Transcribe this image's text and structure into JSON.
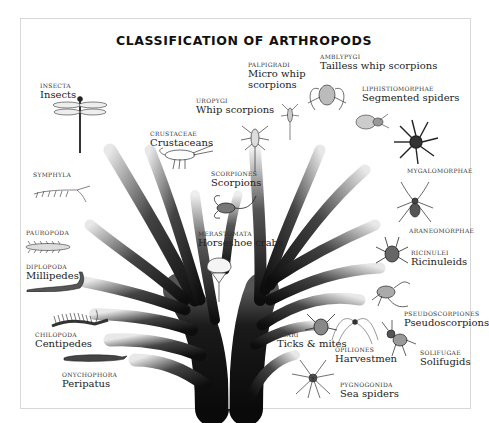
{
  "title": "CLASSIFICATION OF ARTHROPODS",
  "colors": {
    "branch": "#111111",
    "background": "#ffffff",
    "frame": "#d8d8d8",
    "text": "#1a1a1a"
  },
  "groups": [
    {
      "id": "insecta",
      "scientific": "INSECTA",
      "common": "Insects",
      "icon": "dragonfly-icon"
    },
    {
      "id": "crustaceae",
      "scientific": "CRUSTACEAE",
      "common": "Crustaceans",
      "icon": "lobster-icon"
    },
    {
      "id": "uropygi",
      "scientific": "UROPYGI",
      "common": "Whip scorpions",
      "icon": "whip-scorpion-icon"
    },
    {
      "id": "palpigradi",
      "scientific": "PALPIGRADI",
      "common": "Micro whip scorpions",
      "common_lines": [
        "Micro whip",
        "scorpions"
      ],
      "icon": "micro-whip-scorpion-icon"
    },
    {
      "id": "amblypygi",
      "scientific": "AMBLYPYGI",
      "common": "Tailless whip scorpions",
      "icon": "tailless-whip-scorpion-icon"
    },
    {
      "id": "liphistiomorphae",
      "scientific": "LIPHISTIOMORPHAE",
      "common": "Segmented spiders",
      "icon": "segmented-spider-icon"
    },
    {
      "id": "mygalomorphae",
      "scientific": "MYGALOMORPHAE",
      "common": "",
      "icon": "tarantula-icon"
    },
    {
      "id": "araneomorphae",
      "scientific": "ARANEOMORPHAE",
      "common": "",
      "icon": "spider-icon"
    },
    {
      "id": "ricinulei",
      "scientific": "RICINULEI",
      "common": "Ricinuleids",
      "icon": "ricinuleid-icon"
    },
    {
      "id": "pseudoscorpiones",
      "scientific": "PSEUDOSCORPIONES",
      "common": "Pseudoscorpions",
      "icon": "pseudoscorpion-icon"
    },
    {
      "id": "solifugae",
      "scientific": "SOLIFUGAE",
      "common": "Solifugids",
      "icon": "solifugid-icon"
    },
    {
      "id": "opiliones",
      "scientific": "OPILIONES",
      "common": "Harvestmen",
      "icon": "harvestman-icon"
    },
    {
      "id": "acari",
      "scientific": "ACARI",
      "common": "Ticks & mites",
      "icon": "mite-icon"
    },
    {
      "id": "pygnogonida",
      "scientific": "PYGNOGONIDA",
      "common": "Sea spiders",
      "icon": "sea-spider-icon"
    },
    {
      "id": "scorpiones",
      "scientific": "SCORPIONES",
      "common": "Scorpions",
      "icon": "scorpion-icon"
    },
    {
      "id": "merastomata",
      "scientific": "MERASTOMATA",
      "common": "Horseshoe crabs",
      "icon": "horseshoe-crab-icon"
    },
    {
      "id": "symphyla",
      "scientific": "SYMPHYLA",
      "common": "",
      "icon": "symphylan-icon"
    },
    {
      "id": "pauropoda",
      "scientific": "PAUROPODA",
      "common": "",
      "icon": "pauropod-icon"
    },
    {
      "id": "diplopoda",
      "scientific": "DIPLOPODA",
      "common": "Millipedes",
      "icon": "millipede-icon"
    },
    {
      "id": "chilopoda",
      "scientific": "CHILOPODA",
      "common": "Centipedes",
      "icon": "centipede-icon"
    },
    {
      "id": "onychophora",
      "scientific": "ONYCHOPHORA",
      "common": "Peripatus",
      "icon": "peripatus-icon"
    }
  ]
}
